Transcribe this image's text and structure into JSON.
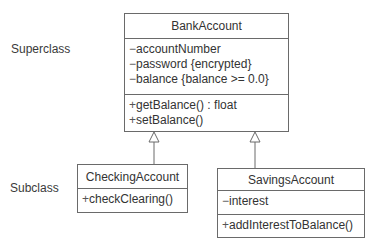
{
  "labels": {
    "superclass": "Superclass",
    "subclass": "Subclass"
  },
  "classes": {
    "bank_account": {
      "name": "BankAccount",
      "attributes": [
        {
          "visibility": "−",
          "text": "accountNumber"
        },
        {
          "visibility": "−",
          "text": "password {encrypted}"
        },
        {
          "visibility": "−",
          "text": "balance {balance >= 0.0}"
        }
      ],
      "methods": [
        {
          "visibility": "+",
          "text": "getBalance() : float"
        },
        {
          "visibility": "+",
          "text": "setBalance()"
        }
      ]
    },
    "checking_account": {
      "name": "CheckingAccount",
      "methods": [
        {
          "visibility": "+",
          "text": "checkClearing()"
        }
      ]
    },
    "savings_account": {
      "name": "SavingsAccount",
      "attributes": [
        {
          "visibility": "−",
          "text": "interest"
        }
      ],
      "methods": [
        {
          "visibility": "+",
          "text": "addInterestToBalance()"
        }
      ]
    }
  },
  "relationships": [
    {
      "type": "generalization",
      "from": "CheckingAccount",
      "to": "BankAccount"
    },
    {
      "type": "generalization",
      "from": "SavingsAccount",
      "to": "BankAccount"
    }
  ],
  "colors": {
    "line": "#6a6a6a",
    "text": "#333333"
  }
}
